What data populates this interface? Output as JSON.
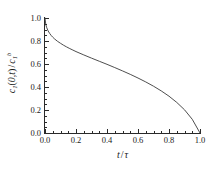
{
  "chart_data": {
    "type": "line",
    "title": "",
    "subtitle": "",
    "xlabel_parts": {
      "var": "t",
      "op": "/",
      "denom": "τ"
    },
    "xlabel": "t / τ",
    "ylabel_parts": {
      "sym": "c",
      "sub1": "1",
      "paren_open": "(",
      "args": "0,t",
      "paren_close": ")",
      "op": "/",
      "sym2": "c",
      "sub2": "1",
      "sup2": "b"
    },
    "ylabel": "c1(0,t) / c1b",
    "xlim": [
      0.0,
      1.0
    ],
    "ylim": [
      0.0,
      1.0
    ],
    "grid": false,
    "legend": "none",
    "xticks": [
      "0.0",
      "0.2",
      "0.4",
      "0.6",
      "0.8",
      "1.0"
    ],
    "xtick_values": [
      0.0,
      0.2,
      0.4,
      0.6,
      0.8,
      1.0
    ],
    "yticks": [
      "0.0",
      "0.2",
      "0.4",
      "0.6",
      "0.8",
      "1.0"
    ],
    "ytick_values": [
      0.0,
      0.2,
      0.4,
      0.6,
      0.8,
      1.0
    ],
    "x_minor_step": 0.05,
    "y_minor_step": 0.05,
    "series": [
      {
        "name": "c1(0,t)/c1b",
        "color": "#3a3a3a",
        "linewidth": 0.9,
        "x": [
          0.0,
          0.005,
          0.01,
          0.02,
          0.03,
          0.04,
          0.05,
          0.06,
          0.08,
          0.1,
          0.12,
          0.14,
          0.16,
          0.18,
          0.2,
          0.25,
          0.3,
          0.35,
          0.4,
          0.45,
          0.5,
          0.55,
          0.6,
          0.65,
          0.7,
          0.75,
          0.8,
          0.85,
          0.9,
          0.95,
          1.0
        ],
        "y": [
          1.0,
          0.945,
          0.92,
          0.888,
          0.866,
          0.848,
          0.833,
          0.82,
          0.798,
          0.78,
          0.763,
          0.748,
          0.734,
          0.721,
          0.708,
          0.679,
          0.651,
          0.624,
          0.597,
          0.569,
          0.54,
          0.51,
          0.478,
          0.444,
          0.407,
          0.366,
          0.32,
          0.266,
          0.202,
          0.119,
          0.0
        ]
      }
    ]
  }
}
